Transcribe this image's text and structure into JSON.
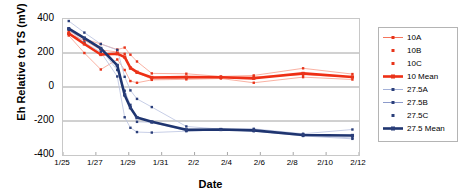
{
  "chart_data": {
    "type": "line",
    "title": "",
    "xlabel": "Date",
    "ylabel": "Eh Relative to TS (mV)",
    "ylim": [
      -400,
      400
    ],
    "yticks": [
      400,
      200,
      0,
      -200,
      -400
    ],
    "xticks": [
      "1/25",
      "1/27",
      "1/29",
      "1/31",
      "2/2",
      "2/4",
      "2/6",
      "2/8",
      "2/10",
      "2/12"
    ],
    "xlim": [
      "1/25",
      "2/12"
    ],
    "grid": "horizontal",
    "legend_position": "right",
    "colors": {
      "replicate_red": "#f4654a",
      "mean_red": "#ee2f15",
      "replicate_blue": "#9aa8d4",
      "mean_blue": "#1f3570",
      "marker_red": "#e8341a",
      "marker_blue": "#2b3f7a",
      "gridline": "#8c8c8c",
      "frame": "#c8c8c8"
    },
    "x_days": [
      0.35,
      1.3,
      2.3,
      3.3,
      3.75,
      4.1,
      4.5,
      5.4,
      7.5,
      9.6,
      11.6,
      14.6,
      17.6
    ],
    "series": [
      {
        "name": "10A",
        "group": "10",
        "role": "replicate",
        "color": "#f4654a",
        "x": [
          0.35,
          1.3,
          2.3,
          3.3,
          3.75,
          4.1,
          4.5,
          5.4,
          7.5,
          9.6,
          11.6,
          14.6,
          17.6
        ],
        "values": [
          330,
          283,
          253,
          220,
          232,
          190,
          150,
          80,
          78,
          62,
          68,
          110,
          76
        ]
      },
      {
        "name": "10B",
        "group": "10",
        "role": "replicate",
        "color": "#f4654a",
        "x": [
          0.35,
          1.3,
          2.3,
          3.3,
          3.75,
          4.1,
          4.5,
          5.4,
          7.5,
          9.6,
          11.6,
          14.6,
          17.6
        ],
        "values": [
          312,
          275,
          218,
          206,
          195,
          110,
          85,
          46,
          52,
          58,
          60,
          72,
          58
        ]
      },
      {
        "name": "10C",
        "group": "10",
        "role": "replicate",
        "color": "#f4654a",
        "x": [
          0.35,
          1.3,
          2.3,
          3.3,
          3.75,
          4.1,
          4.5,
          5.4,
          7.5,
          9.6,
          11.6,
          14.6,
          17.6
        ],
        "values": [
          303,
          200,
          103,
          162,
          100,
          35,
          25,
          42,
          45,
          50,
          25,
          58,
          44
        ]
      },
      {
        "name": "10 Mean",
        "group": "10",
        "role": "mean",
        "color": "#ee2f15",
        "x": [
          0.35,
          1.3,
          2.3,
          3.3,
          3.75,
          4.1,
          4.5,
          5.4,
          7.5,
          9.6,
          11.6,
          14.6,
          17.6
        ],
        "values": [
          315,
          253,
          191,
          196,
          176,
          112,
          87,
          56,
          58,
          57,
          51,
          80,
          59
        ]
      },
      {
        "name": "27.5A",
        "group": "27.5",
        "role": "replicate",
        "color": "#9aa8d4",
        "x": [
          0.35,
          1.3,
          2.3,
          3.3,
          3.75,
          4.1,
          4.5,
          5.4,
          7.5,
          9.6,
          11.6,
          14.6,
          17.6
        ],
        "values": [
          388,
          320,
          253,
          218,
          60,
          -20,
          -70,
          -118,
          -232,
          -248,
          -246,
          -275,
          -250
        ]
      },
      {
        "name": "27.5B",
        "group": "27.5",
        "role": "replicate",
        "color": "#9aa8d4",
        "x": [
          0.35,
          1.3,
          2.3,
          3.3,
          3.75,
          4.1,
          4.5,
          5.4,
          7.5,
          9.6,
          11.6,
          14.6,
          17.6
        ],
        "values": [
          345,
          283,
          222,
          100,
          -22,
          -105,
          -205,
          -208,
          -257,
          -250,
          -260,
          -283,
          -300
        ]
      },
      {
        "name": "27.5C",
        "group": "27.5",
        "role": "replicate",
        "color": "#9aa8d4",
        "x": [
          0.35,
          1.3,
          2.3,
          3.3,
          3.75,
          4.1,
          4.5,
          5.4,
          7.5,
          9.6,
          11.6,
          14.6,
          17.6
        ],
        "values": [
          337,
          262,
          205,
          62,
          -178,
          -240,
          -265,
          -268,
          -260,
          -252,
          -258,
          -288,
          -305
        ]
      },
      {
        "name": "27.5 Mean",
        "group": "27.5",
        "role": "mean",
        "color": "#1f3570",
        "x": [
          0.35,
          1.3,
          2.3,
          3.3,
          3.75,
          4.1,
          4.5,
          5.4,
          7.5,
          9.6,
          11.6,
          14.6,
          17.6
        ],
        "values": [
          343,
          288,
          227,
          127,
          -47,
          -122,
          -180,
          -205,
          -252,
          -250,
          -255,
          -282,
          -285
        ]
      }
    ]
  },
  "legend": {
    "items": [
      {
        "label": "10A",
        "marker": "square-line",
        "color": "#f4654a",
        "weight": "thin"
      },
      {
        "label": "10B",
        "marker": "square",
        "color": "#f4654a",
        "weight": "none"
      },
      {
        "label": "10C",
        "marker": "square",
        "color": "#f4654a",
        "weight": "none"
      },
      {
        "label": "10 Mean",
        "marker": "square-line",
        "color": "#ee2f15",
        "weight": "thick"
      },
      {
        "label": "27.5A",
        "marker": "square-line",
        "color": "#9aa8d4",
        "weight": "thin"
      },
      {
        "label": "27.5B",
        "marker": "square-line",
        "color": "#7f8fc4",
        "weight": "thin"
      },
      {
        "label": "27.5C",
        "marker": "square",
        "color": "#8f9ccb",
        "weight": "none"
      },
      {
        "label": "27.5 Mean",
        "marker": "square-line",
        "color": "#1f3570",
        "weight": "thick"
      }
    ]
  }
}
